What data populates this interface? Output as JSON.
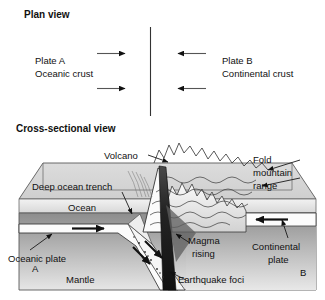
{
  "figure": {
    "background_color": "#ffffff",
    "line_color": "#1a1a1a"
  },
  "plan_view": {
    "title": "Plan view",
    "divider_name": "plate-boundary-line",
    "left_plate": {
      "name": "Plate A",
      "crust": "Oceanic crust"
    },
    "right_plate": {
      "name": "Plate B",
      "crust": "Continental crust"
    },
    "arrows": [
      {
        "name": "plan-arrow-left-upper",
        "direction": "right"
      },
      {
        "name": "plan-arrow-left-lower",
        "direction": "right"
      },
      {
        "name": "plan-arrow-right-upper",
        "direction": "left"
      },
      {
        "name": "plan-arrow-right-lower",
        "direction": "left"
      }
    ]
  },
  "cross_section": {
    "title": "Cross-sectional view",
    "labels": {
      "volcano": "Volcano",
      "fold_mountain_line1": "Fold",
      "fold_mountain_line2": "mountain",
      "fold_mountain_line3": "range",
      "deep_ocean_trench": "Deep ocean trench",
      "ocean": "Ocean",
      "oceanic_plate": "Oceanic plate",
      "continental_plate_line1": "Continental",
      "continental_plate_line2": "plate",
      "magma_line1": "Magma",
      "magma_line2": "rising",
      "earthquake_foci": "Earthquake foci",
      "mantle": "Mantle",
      "marker_a": "A",
      "marker_b": "B"
    },
    "arrows": [
      {
        "name": "oceanic-plate-motion-arrow",
        "direction": "right"
      },
      {
        "name": "continental-plate-motion-arrow",
        "direction": "left"
      },
      {
        "name": "subduction-arrow-upper",
        "direction": "down-right"
      },
      {
        "name": "subduction-arrow-lower",
        "direction": "down-right"
      }
    ],
    "colors": {
      "block_top": "#d9d9d9",
      "block_side": "#c9c9c9",
      "ocean_band": "#e8e8e8",
      "mantle_dark": "#8f8f8f",
      "mantle_light": "#e3e3e3",
      "plate_white": "#fdfdfd",
      "magma_dark": "#2b2b2b"
    }
  }
}
